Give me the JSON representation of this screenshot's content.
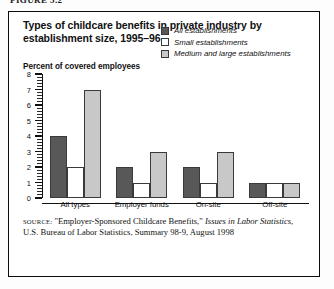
{
  "figure_label": "FIGURE 5.2",
  "title": "Types of childcare benefits in private industry by establishment size, 1995–96",
  "axis_title": "Percent of covered employees",
  "legend": [
    {
      "label": "All establishments",
      "color": "#585858"
    },
    {
      "label": "Small establishments",
      "color": "#ffffff"
    },
    {
      "label": "Medium and large establishments",
      "color": "#c8c8c8"
    }
  ],
  "source": {
    "keyword": "SOURCE:",
    "line": " \"Employer-Sponsored Childcare Benefits,\" ",
    "italic": "Issues in Labor Statistics",
    "rest": ", U.S. Bureau of Labor Statistics, Summary 98-9, August 1998"
  },
  "chart_data": {
    "type": "bar",
    "title": "Types of childcare benefits in private industry by establishment size, 1995–96",
    "xlabel": "",
    "ylabel": "Percent of covered employees",
    "ylim": [
      0,
      8
    ],
    "yticks": [
      0,
      1,
      2,
      3,
      4,
      5,
      6,
      7,
      8
    ],
    "grid": false,
    "legend_position": "top-right",
    "categories": [
      "All types",
      "Employer funds",
      "On-site",
      "Off-site"
    ],
    "series": [
      {
        "name": "All establishments",
        "color": "#585858",
        "values": [
          4,
          2,
          2,
          1
        ]
      },
      {
        "name": "Small establishments",
        "color": "#ffffff",
        "values": [
          2,
          1,
          1,
          1
        ]
      },
      {
        "name": "Medium and large establishments",
        "color": "#c8c8c8",
        "values": [
          7,
          3,
          3,
          1
        ]
      }
    ]
  }
}
